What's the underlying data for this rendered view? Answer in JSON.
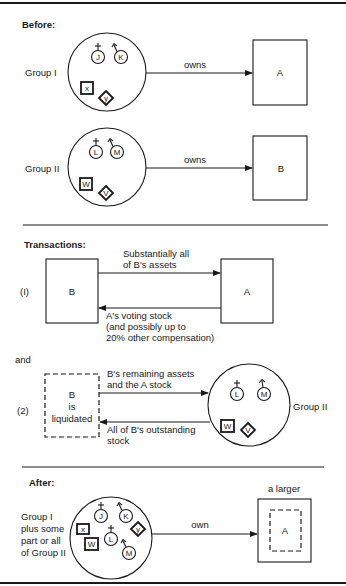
{
  "before": {
    "heading": "Before:",
    "group1": {
      "label": "Group I",
      "members": {
        "male1": "J",
        "male2": "K",
        "corp_square": "x",
        "corp_diamond": "y"
      },
      "arrow_label": "owns",
      "target": "A"
    },
    "group2": {
      "label": "Group II",
      "members": {
        "male1": "L",
        "male2": "M",
        "corp_square": "W",
        "corp_diamond": "V"
      },
      "arrow_label": "owns",
      "target": "B"
    }
  },
  "transactions": {
    "heading": "Transactions:",
    "step1": {
      "number": "(I)",
      "left_box": "B",
      "right_box": "A",
      "top_arrow_label": [
        "Substantially all",
        "of B's assets"
      ],
      "bottom_arrow_label": [
        "A's voting stock",
        "(and possibly up to",
        "20% other compensation)"
      ]
    },
    "connector": "and",
    "step2": {
      "number": "(2)",
      "left_box": [
        "B",
        "is",
        "liquidated"
      ],
      "top_arrow_label": [
        "B's remaining assets",
        "and the A stock"
      ],
      "bottom_arrow_label": [
        "All of B's outstanding",
        "stock"
      ],
      "group_label": "Group II",
      "members": {
        "male1": "L",
        "male2": "M",
        "corp_square": "W",
        "corp_diamond": "V"
      }
    }
  },
  "after": {
    "heading": "After:",
    "group_label": [
      "Group I",
      "plus some",
      "part or all",
      "of Group II"
    ],
    "members": {
      "j": "J",
      "k": "K",
      "l": "L",
      "m": "M",
      "x": "x",
      "w": "W",
      "y": "y"
    },
    "arrow_label": "own",
    "target_caption": "a larger",
    "target": "A"
  }
}
